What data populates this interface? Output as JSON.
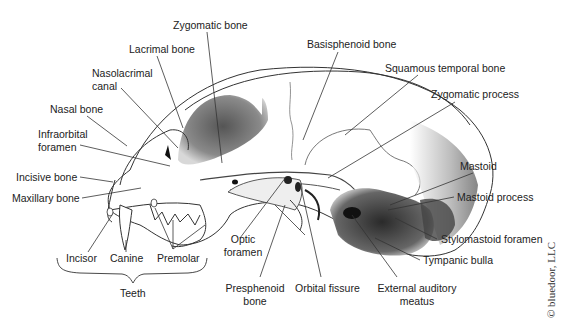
{
  "figure": {
    "labels": {
      "zygomatic_bone": "Zygomatic bone",
      "lacrimal_bone": "Lacrimal bone",
      "nasolacrimal_canal_1": "Nasolacrimal",
      "nasolacrimal_canal_2": "canal",
      "nasal_bone": "Nasal bone",
      "infraorbital_foramen_1": "Infraorbital",
      "infraorbital_foramen_2": "foramen",
      "incisive_bone": "Incisive bone",
      "maxillary_bone": "Maxillary bone",
      "incisor": "Incisor",
      "canine": "Canine",
      "premolar": "Premolar",
      "teeth": "Teeth",
      "optic_foramen_1": "Optic",
      "optic_foramen_2": "foramen",
      "presphenoid_bone_1": "Presphenoid",
      "presphenoid_bone_2": "bone",
      "orbital_fissure": "Orbital fissure",
      "external_auditory_meatus_1": "External auditory",
      "external_auditory_meatus_2": "meatus",
      "basisphenoid_bone": "Basisphenoid bone",
      "squamous_temporal_bone": "Squamous temporal bone",
      "zygomatic_process": "Zygomatic process",
      "mastoid": "Mastoid",
      "mastoid_process": "Mastoid process",
      "stylomastoid_foramen": "Stylomastoid foramen",
      "tympanic_bulla": "Tympanic bulla"
    },
    "credit": "© bluedoor, LLC"
  }
}
